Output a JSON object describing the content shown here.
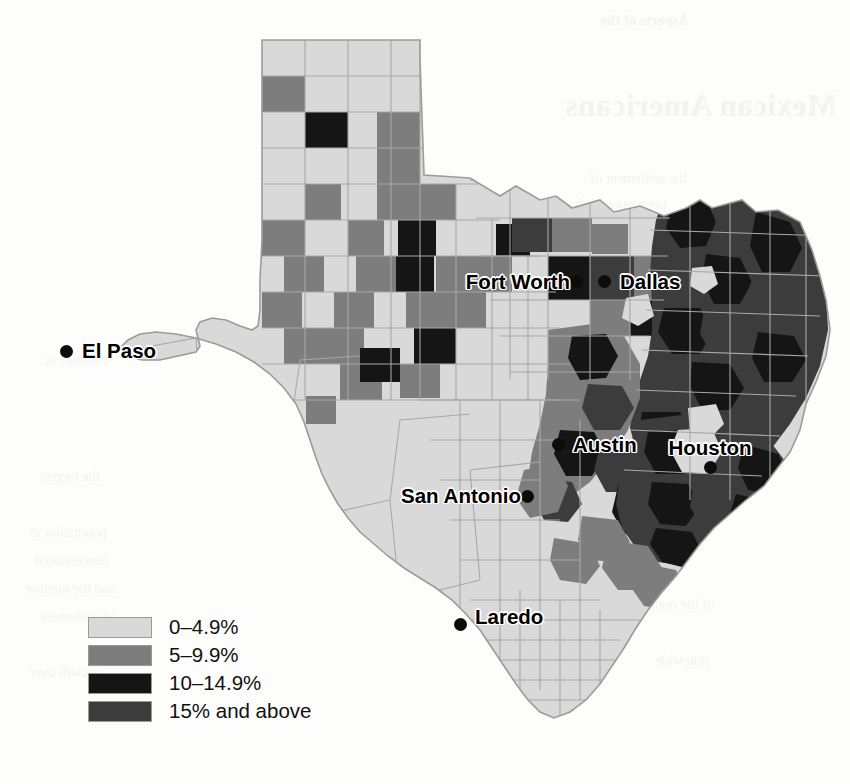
{
  "figure": {
    "type": "choropleth-map",
    "region": "Texas",
    "unit": "county"
  },
  "legend": {
    "name": "map-legend",
    "items": [
      {
        "label": "0–4.9%",
        "color": "#d9d9d9",
        "range_min": 0,
        "range_max": 4.9
      },
      {
        "label": "5–9.9%",
        "color": "#7d7d7d",
        "range_min": 5,
        "range_max": 9.9
      },
      {
        "label": "10–14.9%",
        "color": "#151515",
        "range_min": 10,
        "range_max": 14.9
      },
      {
        "label": "15% and above",
        "color": "#3c3c3c",
        "range_min": 15,
        "range_max": null
      }
    ]
  },
  "cities": [
    {
      "name": "El Paso",
      "label": "El Paso",
      "dot_x": 66,
      "dot_y": 351,
      "label_x": 82,
      "label_y": 351,
      "anchor": "right"
    },
    {
      "name": "Fort Worth",
      "label": "Fort Worth",
      "dot_x": 576,
      "dot_y": 281,
      "label_x": 570,
      "label_y": 282,
      "anchor": "left"
    },
    {
      "name": "Dallas",
      "label": "Dallas",
      "dot_x": 604,
      "dot_y": 281,
      "label_x": 620,
      "label_y": 282,
      "anchor": "right"
    },
    {
      "name": "Austin",
      "label": "Austin",
      "dot_x": 558,
      "dot_y": 444,
      "label_x": 573,
      "label_y": 445,
      "anchor": "right"
    },
    {
      "name": "Houston",
      "label": "Houston",
      "dot_x": 710,
      "dot_y": 467,
      "label_x": 710,
      "label_y": 458,
      "anchor": "above"
    },
    {
      "name": "San Antonio",
      "label": "San Antonio",
      "dot_x": 527,
      "dot_y": 496,
      "label_x": 521,
      "label_y": 496,
      "anchor": "left"
    },
    {
      "name": "Laredo",
      "label": "Laredo",
      "dot_x": 460,
      "dot_y": 624,
      "label_x": 475,
      "label_y": 617,
      "anchor": "right"
    }
  ],
  "bleed_through": [
    {
      "text": "Aspects of the",
      "x": 600,
      "y": 12,
      "cls": "bleed-sub"
    },
    {
      "text": "Mexican Americans",
      "x": 565,
      "y": 88,
      "cls": "bleed-head"
    },
    {
      "text": "the settlement of",
      "x": 590,
      "y": 170,
      "cls": "bleed-body"
    },
    {
      "text": "population shift",
      "x": 575,
      "y": 196,
      "cls": "bleed-body"
    },
    {
      "text": "the state and",
      "x": 600,
      "y": 222,
      "cls": "bleed-body"
    },
    {
      "text": "percentage of",
      "x": 585,
      "y": 248,
      "cls": "bleed-body"
    },
    {
      "text": "counties in",
      "x": 45,
      "y": 352,
      "cls": "bleed-body"
    },
    {
      "text": "the largest",
      "x": 40,
      "y": 468,
      "cls": "bleed-body"
    },
    {
      "text": "population in",
      "x": 30,
      "y": 524,
      "cls": "bleed-body"
    },
    {
      "text": "concentrated",
      "x": 35,
      "y": 552,
      "cls": "bleed-body"
    },
    {
      "text": "and the number",
      "x": 25,
      "y": 580,
      "cls": "bleed-body"
    },
    {
      "text": "of settlement",
      "x": 40,
      "y": 608,
      "cls": "bleed-body"
    },
    {
      "text": "growth over",
      "x": 30,
      "y": 664,
      "cls": "bleed-body"
    },
    {
      "text": "distribution",
      "x": 620,
      "y": 540,
      "cls": "bleed-body"
    },
    {
      "text": "of the region",
      "x": 640,
      "y": 596,
      "cls": "bleed-body"
    },
    {
      "text": "statewide",
      "x": 655,
      "y": 652,
      "cls": "bleed-body"
    }
  ],
  "chart_data": {
    "type": "heatmap",
    "title": "",
    "xlabel": "",
    "ylabel": "",
    "legend_position": "bottom-left",
    "grid": false,
    "categories": [
      "0–4.9%",
      "5–9.9%",
      "10–14.9%",
      "15% and above"
    ],
    "category_colors": [
      "#d9d9d9",
      "#7d7d7d",
      "#151515",
      "#3c3c3c"
    ],
    "regional_summary": [
      {
        "region": "Panhandle",
        "dominant_class": "0–4.9%",
        "notes": "checkerboard of scattered 5–9.9% and a few 10–14.9% counties"
      },
      {
        "region": "West Texas / Big Bend",
        "dominant_class": "0–4.9%",
        "notes": "almost uniformly lightest class; one 5–9.9% county"
      },
      {
        "region": "El Paso area",
        "dominant_class": "0–4.9%",
        "notes": "lightest class"
      },
      {
        "region": "North Central (Dallas–Fort Worth)",
        "dominant_class": "10–14.9%",
        "notes": "urban core counties dark; surrounding mix of 5–9.9%"
      },
      {
        "region": "East Texas",
        "dominant_class": "15% and above",
        "notes": "densest concentration of the two darkest classes"
      },
      {
        "region": "Gulf Coast / Houston",
        "dominant_class": "15% and above",
        "notes": "dark cluster around Houston and the upper coast"
      },
      {
        "region": "Central (Austin)",
        "dominant_class": "5–9.9%",
        "notes": "moderate class with darker counties to the east"
      },
      {
        "region": "South Texas",
        "dominant_class": "0–4.9%",
        "notes": "lightest class from San Antonio south to the Rio Grande"
      }
    ],
    "county_values": [
      {
        "id": "pan-0-0",
        "class": 0
      },
      {
        "id": "pan-1-0",
        "class": 0
      },
      {
        "id": "pan-2-0",
        "class": 0
      },
      {
        "id": "pan-3-0",
        "class": 0
      },
      {
        "id": "pan-4-0",
        "class": 0
      },
      {
        "id": "pan-0-1",
        "class": 1
      },
      {
        "id": "pan-1-1",
        "class": 0
      },
      {
        "id": "pan-2-1",
        "class": 0
      },
      {
        "id": "pan-3-1",
        "class": 0
      },
      {
        "id": "pan-4-1",
        "class": 0
      },
      {
        "id": "pan-0-2",
        "class": 0
      },
      {
        "id": "pan-1-2",
        "class": 2
      },
      {
        "id": "pan-2-2",
        "class": 0
      },
      {
        "id": "pan-3-2",
        "class": 1
      },
      {
        "id": "pan-4-2",
        "class": 0
      },
      {
        "id": "pan-0-3",
        "class": 0
      },
      {
        "id": "pan-1-3",
        "class": 0
      },
      {
        "id": "pan-2-3",
        "class": 0
      },
      {
        "id": "pan-3-3",
        "class": 1
      },
      {
        "id": "pan-4-3",
        "class": 1
      },
      {
        "id": "pan-0-4",
        "class": 0
      },
      {
        "id": "pan-1-4",
        "class": 0
      },
      {
        "id": "pan-2-4",
        "class": 1
      },
      {
        "id": "pan-3-4",
        "class": 0
      },
      {
        "id": "pan-4-4",
        "class": 1
      },
      {
        "id": "pan-5-4",
        "class": 2
      },
      {
        "id": "pan-0-5",
        "class": 0
      },
      {
        "id": "pan-1-5",
        "class": 1
      },
      {
        "id": "pan-2-5",
        "class": 1
      },
      {
        "id": "pan-3-5",
        "class": 0
      },
      {
        "id": "pan-4-5",
        "class": 0
      },
      {
        "id": "pan-5-5",
        "class": 2
      },
      {
        "id": "pan-0-6",
        "class": 1
      },
      {
        "id": "pan-1-6",
        "class": 0
      },
      {
        "id": "pan-2-6",
        "class": 1
      },
      {
        "id": "pan-3-6",
        "class": 0
      },
      {
        "id": "pan-4-6",
        "class": 1
      },
      {
        "id": "pan-5-6",
        "class": 0
      },
      {
        "id": "pan-0-7",
        "class": 0
      },
      {
        "id": "pan-1-7",
        "class": 1
      },
      {
        "id": "pan-2-7",
        "class": 0
      },
      {
        "id": "pan-3-7",
        "class": 1
      },
      {
        "id": "pan-4-7",
        "class": 0
      },
      {
        "id": "pan-5-7",
        "class": 0
      },
      {
        "id": "pan-0-8",
        "class": 0
      },
      {
        "id": "pan-1-8",
        "class": 0
      },
      {
        "id": "pan-2-8",
        "class": 0
      },
      {
        "id": "pan-3-8",
        "class": 0
      },
      {
        "id": "pan-4-8",
        "class": 2
      },
      {
        "id": "pan-5-8",
        "class": 0
      },
      {
        "id": "pan-0-9",
        "class": 0
      },
      {
        "id": "pan-1-9",
        "class": 1
      },
      {
        "id": "pan-2-9",
        "class": 2
      },
      {
        "id": "pan-3-9",
        "class": 1
      },
      {
        "id": "pan-4-9",
        "class": 0
      },
      {
        "id": "dfw-tarrant",
        "class": 2
      },
      {
        "id": "dfw-dallas",
        "class": 2
      },
      {
        "id": "east-1",
        "class": 3
      },
      {
        "id": "east-2",
        "class": 3
      },
      {
        "id": "east-3",
        "class": 2
      },
      {
        "id": "gulf-1",
        "class": 3
      },
      {
        "id": "gulf-2",
        "class": 2
      },
      {
        "id": "gulf-3",
        "class": 3
      },
      {
        "id": "south-1",
        "class": 0
      },
      {
        "id": "south-2",
        "class": 0
      },
      {
        "id": "south-3",
        "class": 0
      },
      {
        "id": "west-1",
        "class": 0
      },
      {
        "id": "west-2",
        "class": 1
      },
      {
        "id": "west-3",
        "class": 0
      }
    ]
  }
}
